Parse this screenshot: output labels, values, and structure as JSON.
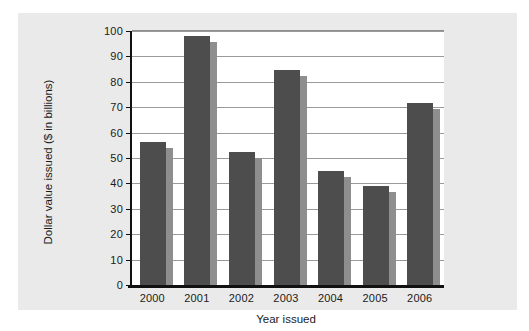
{
  "chart_data": {
    "type": "bar",
    "title": "",
    "xlabel": "Year issued",
    "ylabel": "Dollar value issued ($ in billions)",
    "categories": [
      "2000",
      "2001",
      "2002",
      "2003",
      "2004",
      "2005",
      "2006"
    ],
    "values": [
      56.5,
      98,
      52.5,
      84.5,
      45,
      39,
      71.5
    ],
    "series": [
      {
        "name": "Dollar value issued",
        "values": [
          56.5,
          98,
          52.5,
          84.5,
          45,
          39,
          71.5
        ]
      }
    ],
    "ylim": [
      0,
      100
    ],
    "ytick_labels": [
      "0",
      "10",
      "20",
      "30",
      "40",
      "50",
      "60",
      "70",
      "80",
      "90",
      "100"
    ],
    "ytick_values": [
      0,
      10,
      20,
      30,
      40,
      50,
      60,
      70,
      80,
      90,
      100
    ],
    "grid": "horizontal",
    "legend": "none",
    "bar_color": "#4d4d4d",
    "bar_shadow_color": "#8e8e8e",
    "gridline_color": "#9a9a9a",
    "axis_color": "#111111",
    "plot_background": "#ffffff",
    "figure_background": "#eaeaea"
  }
}
